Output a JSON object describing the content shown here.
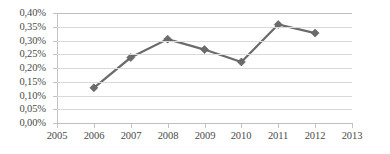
{
  "chart_data": {
    "type": "line",
    "title": "",
    "subtitle": "",
    "xlabel": "",
    "ylabel": "",
    "x": [
      2005,
      2006,
      2007,
      2008,
      2009,
      2010,
      2011,
      2012,
      2013
    ],
    "categories": [
      "2005",
      "2006",
      "2007",
      "2008",
      "2009",
      "2010",
      "2011",
      "2012",
      "2013"
    ],
    "series": [
      {
        "name": "",
        "x": [
          2006,
          2007,
          2008,
          2009,
          2010,
          2011,
          2012
        ],
        "values": [
          0.128,
          0.238,
          0.305,
          0.267,
          0.222,
          0.358,
          0.327
        ],
        "value_labels": [
          "0,13%",
          "0,24%",
          "0,31%",
          "0,27%",
          "0,22%",
          "0,36%",
          "0,33%"
        ],
        "color": "#6b6b6b",
        "marker": "diamond"
      }
    ],
    "ylim": [
      0.0,
      0.4
    ],
    "ytick_step": 0.05,
    "ytick_labels": [
      "0,00%",
      "0,05%",
      "0,10%",
      "0,15%",
      "0,20%",
      "0,25%",
      "0,30%",
      "0,35%",
      "0,40%"
    ],
    "ytick_values": [
      0.0,
      0.05,
      0.1,
      0.15,
      0.2,
      0.25,
      0.3,
      0.35,
      0.4
    ],
    "xtick_labels": [
      "2005",
      "2006",
      "2007",
      "2008",
      "2009",
      "2010",
      "2011",
      "2012",
      "2013"
    ],
    "grid": {
      "horizontal": true,
      "vertical": false
    },
    "legend": {
      "visible": false,
      "position": "none"
    },
    "annotations": [],
    "colors": {
      "series": "#6b6b6b",
      "gridline": "#d9d9d9",
      "axis": "#bfbfbf",
      "label_text": "#4a4a4a",
      "background": "#ffffff"
    }
  }
}
